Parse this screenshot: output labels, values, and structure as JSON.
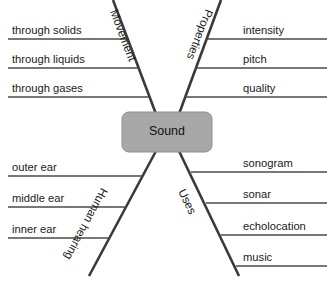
{
  "diagram": {
    "center": {
      "label": "Sound",
      "fill_color": "#a8a8a8",
      "text_color": "#111111"
    },
    "line_color": "#3a3a3a",
    "rule_color": "#4a4a4a",
    "background_color": "#ffffff",
    "branches": [
      {
        "name": "movement",
        "label": "Movement",
        "position": "top-left",
        "leaves": [
          "through solids",
          "through liquids",
          "through gases"
        ]
      },
      {
        "name": "properties",
        "label": "Properties",
        "position": "top-right",
        "leaves": [
          "intensity",
          "pitch",
          "quality"
        ]
      },
      {
        "name": "human-hearing",
        "label": "Human hearing",
        "position": "bottom-left",
        "leaves": [
          "outer ear",
          "middle ear",
          "inner ear"
        ]
      },
      {
        "name": "uses",
        "label": "Uses",
        "position": "bottom-right",
        "leaves": [
          "sonogram",
          "sonar",
          "echolocation",
          "music"
        ]
      }
    ]
  }
}
